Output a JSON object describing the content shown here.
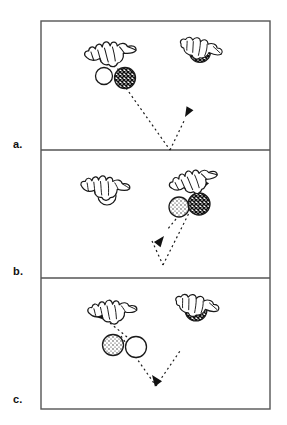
{
  "figure": {
    "caption_labels": [
      "a.",
      "b.",
      "c."
    ],
    "frame": {
      "x": 41,
      "y": 21,
      "width": 229,
      "height": 388,
      "border_color": "#555555",
      "border_width_px": 1.4,
      "background": "#ffffff"
    },
    "panels": [
      {
        "id": "panel-a",
        "label": "a.",
        "label_x": 13,
        "label_y": 139,
        "rect": {
          "x": 41,
          "y": 21,
          "width": 229,
          "height": 129
        },
        "divider_y": 150,
        "hands": [
          {
            "name": "left-hand",
            "cx": 110,
            "cy": 52,
            "scale": 1.0,
            "rotation": -8,
            "state": "open-releasing",
            "holds_ball": false
          },
          {
            "name": "right-hand",
            "cx": 200,
            "cy": 48,
            "scale": 0.88,
            "rotation": 12,
            "state": "gripping",
            "holds_ball": true,
            "held_ball_fill": "crosshatch-dark"
          }
        ],
        "balls": [
          {
            "name": "ball-white",
            "cx": 104,
            "cy": 76,
            "r": 8.5,
            "fill": "white"
          },
          {
            "name": "ball-dark",
            "cx": 125,
            "cy": 78,
            "r": 10.5,
            "fill": "crosshatch-dark"
          }
        ],
        "trajectories": [
          {
            "name": "path-toss-down-right",
            "points": "126,88 170,150",
            "dashed": true
          },
          {
            "name": "path-rise-up-right",
            "points": "170,150 184,120",
            "dashed": true
          },
          {
            "name": "path-short-to-left-hand",
            "points": "120,70 106,60",
            "dashed": true
          }
        ],
        "arrowheads": [
          {
            "name": "arrowhead-up-left",
            "x": 104,
            "y": 60,
            "angle": -130,
            "size": 8
          },
          {
            "name": "arrowhead-up-right",
            "x": 184,
            "y": 118,
            "angle": -62,
            "size": 9
          }
        ]
      },
      {
        "id": "panel-b",
        "label": "b.",
        "label_x": 13,
        "label_y": 266,
        "rect": {
          "x": 41,
          "y": 150,
          "width": 229,
          "height": 128
        },
        "divider_y": 278,
        "hands": [
          {
            "name": "left-hand",
            "cx": 105,
            "cy": 186,
            "scale": 0.95,
            "rotation": 2,
            "state": "open-empty",
            "holds_ball": false
          },
          {
            "name": "right-hand",
            "cx": 193,
            "cy": 180,
            "scale": 0.95,
            "rotation": -16,
            "state": "open-catching",
            "holds_ball": false
          }
        ],
        "balls": [
          {
            "name": "ball-light-stippled",
            "cx": 179,
            "cy": 207,
            "r": 10,
            "fill": "stipple-light"
          },
          {
            "name": "ball-dark",
            "cx": 199,
            "cy": 204,
            "r": 11,
            "fill": "crosshatch-dark"
          }
        ],
        "trajectories": [
          {
            "name": "path-falling-down-left",
            "points": "176,218 166,231",
            "dashed": true
          },
          {
            "name": "path-bounce-left-leg",
            "points": "152,240 163,265",
            "dashed": true
          },
          {
            "name": "path-bounce-right-leg",
            "points": "163,265 196,196",
            "dashed": true
          }
        ],
        "arrowheads": [
          {
            "name": "arrowhead-down-left",
            "x": 164,
            "y": 234,
            "angle": 125,
            "size": 9
          },
          {
            "name": "arrowhead-up-right",
            "x": 198,
            "y": 192,
            "angle": -64,
            "size": 10
          }
        ]
      },
      {
        "id": "panel-c",
        "label": "c.",
        "label_x": 13,
        "label_y": 394,
        "rect": {
          "x": 41,
          "y": 278,
          "width": 229,
          "height": 131
        },
        "divider_y": 409,
        "hands": [
          {
            "name": "left-hand",
            "cx": 112,
            "cy": 310,
            "scale": 0.95,
            "rotation": -4,
            "state": "open-empty",
            "holds_ball": false
          },
          {
            "name": "right-hand",
            "cx": 196,
            "cy": 305,
            "scale": 0.9,
            "rotation": 10,
            "state": "gripping",
            "holds_ball": true,
            "held_ball_fill": "crosshatch-dark"
          }
        ],
        "balls": [
          {
            "name": "ball-stippled",
            "cx": 113,
            "cy": 345,
            "r": 10.5,
            "fill": "stipple-light"
          },
          {
            "name": "ball-white",
            "cx": 136,
            "cy": 347,
            "r": 10.5,
            "fill": "white"
          }
        ],
        "trajectories": [
          {
            "name": "path-rising-up-left",
            "points": "127,337 109,322",
            "dashed": true
          },
          {
            "name": "path-descend-left-leg",
            "points": "120,336 155,385",
            "dashed": true
          },
          {
            "name": "path-ascend-right-leg",
            "points": "155,385 179,352",
            "dashed": true
          }
        ],
        "arrowheads": [
          {
            "name": "arrowhead-up-left",
            "x": 107,
            "y": 321,
            "angle": -142,
            "size": 10
          },
          {
            "name": "arrowhead-down-right",
            "x": 150,
            "y": 372,
            "angle": 55,
            "size": 10
          }
        ]
      }
    ],
    "style": {
      "ink_color": "#1a1a1a",
      "dash_pattern": "2 3",
      "dash_width_px": 1.2,
      "stroke_width_px": 1.2,
      "ball_dark_fill": "#2b2b2b",
      "ball_light_fill": "#ffffff"
    }
  }
}
